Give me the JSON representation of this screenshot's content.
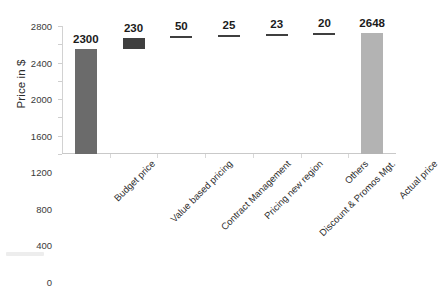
{
  "chart_data": {
    "type": "bar",
    "subtype": "waterfall",
    "title": "",
    "xlabel": "",
    "ylabel": "Price in $",
    "ylim": [
      0,
      2800
    ],
    "ytick_values": [
      0,
      400,
      800,
      1200,
      1600,
      2000,
      2400,
      2800
    ],
    "ytick_labels": [
      "0",
      "400",
      "800",
      "1200",
      "1600",
      "2000",
      "2400",
      "2800"
    ],
    "grid": false,
    "legend": "none",
    "categories": [
      "Budget price",
      "Value based pricing",
      "Contract Management",
      "Pricing new region",
      "Discount & Promos Mgt.",
      "Others",
      "Actual price"
    ],
    "values": [
      2300,
      230,
      50,
      25,
      23,
      20,
      2648
    ],
    "data_labels": [
      "2300",
      "230",
      "50",
      "25",
      "23",
      "20",
      "2648"
    ],
    "bar_kinds": [
      "total",
      "increment",
      "increment",
      "increment",
      "increment",
      "increment",
      "total"
    ],
    "bar_bases": [
      0,
      2300,
      2530,
      2580,
      2605,
      2628,
      0
    ],
    "bar_tops": [
      2300,
      2530,
      2580,
      2605,
      2628,
      2648,
      2648
    ],
    "colors": {
      "total_start": "#6b6b6b",
      "increment": "#3f3f3f",
      "total_end": "#b3b3b3",
      "axis": "#c9c9c9",
      "text": "#1b1b1b"
    }
  },
  "axis": {
    "y_title": "Price in $"
  }
}
